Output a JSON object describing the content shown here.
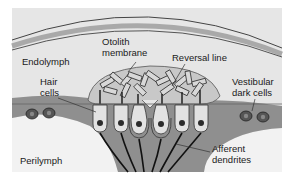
{
  "diagram": {
    "labels": {
      "endolymph": "Endolymph",
      "otolith_line1": "Otolith",
      "otolith_line2": "membrane",
      "reversal_line": "Reversal line",
      "hair_line1": "Hair",
      "hair_line2": "cells",
      "vestibular_line1": "Vestibular",
      "vestibular_line2": "dark cells",
      "perilymph": "Perilymph",
      "afferent_line1": "Afferent",
      "afferent_line2": "dendrites"
    },
    "colors": {
      "background": "#e6e6e6",
      "membrane_band": "#a9a9a9",
      "tissue": "#8f8f8f",
      "otolith_membrane": "#c8c8c8",
      "hair_cell": "#e2e2e2",
      "nucleus": "#2b2b2b",
      "perilymph": "#f2f2f2"
    },
    "hair_cell_count": 6
  }
}
